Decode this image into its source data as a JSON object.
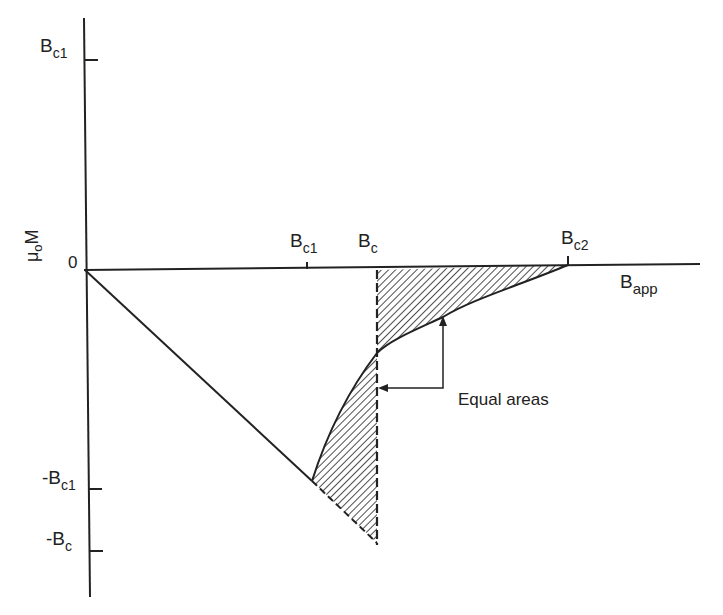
{
  "diagram": {
    "type": "magnetization-curve",
    "y_axis": {
      "label_main": "μ",
      "label_sub": "o",
      "label_after": "M",
      "ticks": [
        {
          "main": "B",
          "sub": "c1",
          "prefix": ""
        },
        {
          "main": "0",
          "sub": "",
          "prefix": ""
        },
        {
          "main": "B",
          "sub": "c1",
          "prefix": "-"
        },
        {
          "main": "B",
          "sub": "c",
          "prefix": "-"
        }
      ]
    },
    "x_axis": {
      "label_main": "B",
      "label_sub": "app",
      "ticks": [
        {
          "main": "B",
          "sub": "c1"
        },
        {
          "main": "B",
          "sub": "c"
        },
        {
          "main": "B",
          "sub": "c2"
        }
      ]
    },
    "annotation": "Equal areas",
    "colors": {
      "ink": "#222222",
      "background": "#ffffff"
    }
  }
}
